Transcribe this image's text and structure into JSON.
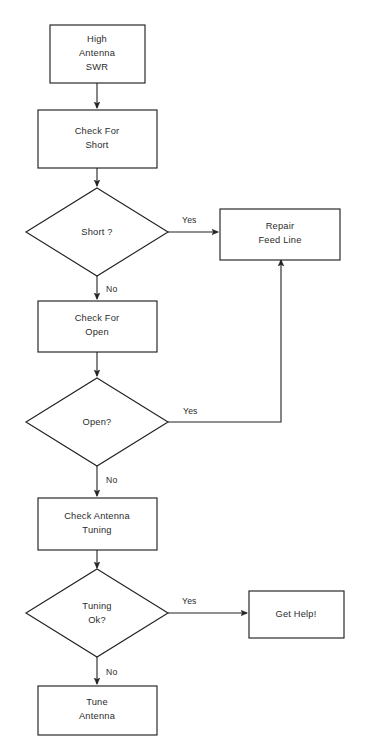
{
  "diagram": {
    "background_color": "#ffffff",
    "line_color": "#222222",
    "text_color": "#2b2b2b",
    "nodes": {
      "high_antenna_swr": {
        "line1": "High",
        "line2": "Antenna",
        "line3": "SWR"
      },
      "check_for_short": {
        "line1": "Check For",
        "line2": "Short"
      },
      "short_decision": {
        "line1": "Short ?"
      },
      "repair_feed_line": {
        "line1": "Repair",
        "line2": "Feed Line"
      },
      "check_for_open": {
        "line1": "Check For",
        "line2": "Open"
      },
      "open_decision": {
        "line1": "Open?"
      },
      "check_antenna_tuning": {
        "line1": "Check Antenna",
        "line2": "Tuning"
      },
      "tuning_ok_decision": {
        "line1": "Tuning",
        "line2": "Ok?"
      },
      "get_help": {
        "line1": "Get Help!"
      },
      "tune_antenna": {
        "line1": "Tune",
        "line2": "Antenna"
      }
    },
    "edge_labels": {
      "short_yes": "Yes",
      "short_no": "No",
      "open_yes": "Yes",
      "open_no": "No",
      "tuning_yes": "Yes",
      "tuning_no": "No"
    }
  }
}
